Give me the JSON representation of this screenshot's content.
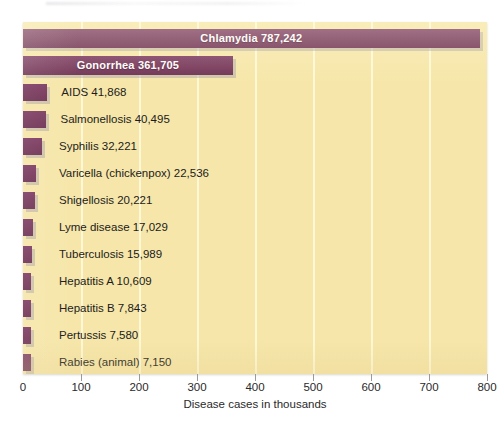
{
  "chart_data": {
    "type": "bar",
    "orientation": "horizontal",
    "title": "",
    "xlabel": "Disease cases in thousands",
    "ylabel": "",
    "xlim": [
      0,
      800
    ],
    "xticks": [
      0,
      100,
      200,
      300,
      400,
      500,
      600,
      700,
      800
    ],
    "xtick_labels": [
      "0",
      "100",
      "200",
      "300",
      "400",
      "500",
      "600",
      "700",
      "800"
    ],
    "grid": "vertical",
    "legend": "none",
    "units": "cases",
    "value_units_note": "axis in thousands of cases",
    "bar_color": "#7d3c64",
    "plot_background": "#f6e6a9",
    "gridline_color": "#fffade",
    "categories": [
      "Chlamydia",
      "Gonorrhea",
      "AIDS",
      "Salmonellosis",
      "Syphilis",
      "Varicella (chickenpox)",
      "Shigellosis",
      "Lyme disease",
      "Tuberculosis",
      "Hepatitis A",
      "Hepatitis B",
      "Pertussis",
      "Rabies (animal)"
    ],
    "values": [
      787242,
      361705,
      41868,
      40495,
      32221,
      22536,
      20221,
      17029,
      15989,
      10609,
      7843,
      7580,
      7150
    ],
    "value_labels": [
      "787,242",
      "361,705",
      "41,868",
      "40,495",
      "32,221",
      "22,536",
      "20,221",
      "17,029",
      "15,989",
      "10,609",
      "7,843",
      "7,580",
      "7,150"
    ],
    "bars": [
      {
        "label": "Chlamydia",
        "value_label": "787,242",
        "value": 787242,
        "label_placement": "inside"
      },
      {
        "label": "Gonorrhea",
        "value_label": "361,705",
        "value": 361705,
        "label_placement": "inside"
      },
      {
        "label": "AIDS",
        "value_label": "41,868",
        "value": 41868,
        "label_placement": "outside"
      },
      {
        "label": "Salmonellosis",
        "value_label": "40,495",
        "value": 40495,
        "label_placement": "outside"
      },
      {
        "label": "Syphilis",
        "value_label": "32,221",
        "value": 32221,
        "label_placement": "outside"
      },
      {
        "label": "Varicella (chickenpox)",
        "value_label": "22,536",
        "value": 22536,
        "label_placement": "outside"
      },
      {
        "label": "Shigellosis",
        "value_label": "20,221",
        "value": 20221,
        "label_placement": "outside"
      },
      {
        "label": "Lyme disease",
        "value_label": "17,029",
        "value": 17029,
        "label_placement": "outside"
      },
      {
        "label": "Tuberculosis",
        "value_label": "15,989",
        "value": 15989,
        "label_placement": "outside"
      },
      {
        "label": "Hepatitis A",
        "value_label": "10,609",
        "value": 10609,
        "label_placement": "outside"
      },
      {
        "label": "Hepatitis B",
        "value_label": "7,843",
        "value": 7843,
        "label_placement": "outside"
      },
      {
        "label": "Pertussis",
        "value_label": "7,580",
        "value": 7580,
        "label_placement": "outside"
      },
      {
        "label": "Rabies (animal)",
        "value_label": "7,150",
        "value": 7150,
        "label_placement": "outside"
      }
    ]
  }
}
